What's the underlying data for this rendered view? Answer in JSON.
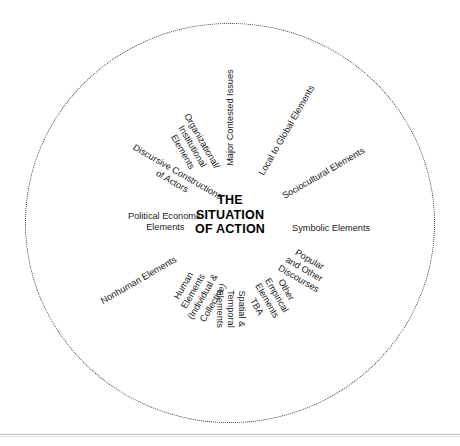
{
  "diagram": {
    "type": "radial-wheel",
    "center": {
      "line1": "THE",
      "line2": "SITUATION",
      "line3": "OF ACTION"
    },
    "boundary": {
      "shape": "circle",
      "style": "dotted",
      "color": "#3a3a3a"
    },
    "elements": [
      {
        "id": "major-contested-issues",
        "line1": "Major Contested Issues",
        "line2": "",
        "angle_deg": -90,
        "clock_position": "12:00"
      },
      {
        "id": "local-to-global-elements",
        "line1": "Local to Global Elements",
        "line2": "",
        "angle_deg": -60,
        "clock_position": "1:00"
      },
      {
        "id": "sociocultural-elements",
        "line1": "Sociocultural Elements",
        "line2": "",
        "angle_deg": -30,
        "clock_position": "2:00"
      },
      {
        "id": "symbolic-elements",
        "line1": "Symbolic Elements",
        "line2": "",
        "angle_deg": 0,
        "clock_position": "3:00"
      },
      {
        "id": "popular-and-other-discourses",
        "line1": "Popular and Other",
        "line2": "Discourses",
        "angle_deg": 30,
        "clock_position": "4:00"
      },
      {
        "id": "other-empirical-elements-tba",
        "line1": "Other Empirical",
        "line2": "Elements TBA",
        "angle_deg": 60,
        "clock_position": "5:00"
      },
      {
        "id": "spatial-and-temporal-elements",
        "line1": "Spatial & Temporal",
        "line2": "Elements",
        "angle_deg": 90,
        "clock_position": "6:00"
      },
      {
        "id": "human-elements",
        "line1": "Human Elements",
        "line2": "(Individual & Collective)",
        "angle_deg": 120,
        "clock_position": "7:00"
      },
      {
        "id": "nonhuman-elements",
        "line1": "Nonhuman Elements",
        "line2": "",
        "angle_deg": 150,
        "clock_position": "8:00"
      },
      {
        "id": "political-economic-elements",
        "line1": "Political Economic",
        "line2": "Elements",
        "angle_deg": 180,
        "clock_position": "9:00"
      },
      {
        "id": "discursive-constructions-of-actors",
        "line1": "Discursive Constructions",
        "line2": "of Actors",
        "angle_deg": 210,
        "clock_position": "10:00"
      },
      {
        "id": "organizational-institutional-elements",
        "line1": "Organizational/",
        "line2": "Institutional Elements",
        "angle_deg": 240,
        "clock_position": "11:00"
      }
    ]
  }
}
